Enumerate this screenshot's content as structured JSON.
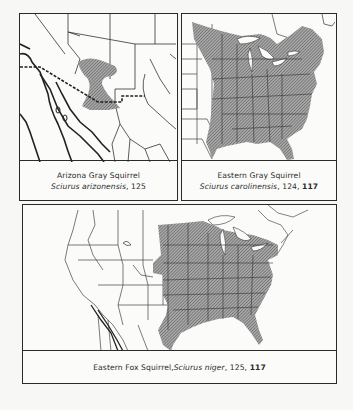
{
  "colors": {
    "border": "#2a2a2a",
    "range_fill": "#8c8c8c",
    "background": "#f7f7f5"
  },
  "panels": [
    {
      "id": "arizona-gray-squirrel",
      "common_name": "Arizona Gray Squirrel",
      "scientific_name": "Sciurus arizonensis",
      "pages": ", 125",
      "bold_page": ""
    },
    {
      "id": "eastern-gray-squirrel",
      "common_name": "Eastern Gray Squirrel",
      "scientific_name": "Sciurus carolinensis",
      "pages": ", 124, ",
      "bold_page": "117"
    },
    {
      "id": "eastern-fox-squirrel",
      "common_name": "Eastern Fox Squirrel, ",
      "scientific_name": "Sciurus niger",
      "pages": ", 125, ",
      "bold_page": "117"
    }
  ]
}
